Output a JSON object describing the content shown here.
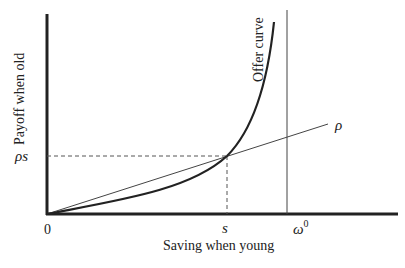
{
  "diagram": {
    "axes": {
      "x_label": "Saving when young",
      "y_label": "Payoff when old",
      "origin_label": "0"
    },
    "curves": {
      "offer_curve_label": "Offer curve",
      "rate_line_label": "ρ"
    },
    "markers": {
      "s_label": "s",
      "rho_s_label": "ρs",
      "omega_label": "ω",
      "omega_superscript": "0"
    },
    "colors": {
      "axis": "#222222",
      "curve": "#222222",
      "line": "#444444",
      "dashed": "#555555",
      "text": "#222222",
      "background": "#ffffff"
    }
  }
}
